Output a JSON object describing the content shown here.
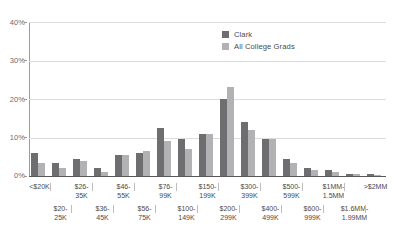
{
  "chart_data": {
    "type": "bar",
    "title": "",
    "subtitle": "",
    "xlabel": "",
    "ylabel": "",
    "ylim": [
      0,
      40
    ],
    "yticks": [
      0,
      10,
      20,
      30,
      40
    ],
    "ytick_labels": [
      "0%",
      "10%",
      "20%",
      "30%",
      "40%"
    ],
    "grid": true,
    "legend_position": "top-right",
    "categories": [
      "<$20K",
      "$20-25K",
      "$26-35K",
      "$36-45K",
      "$46-55K",
      "$56-75K",
      "$76-99K",
      "$100-149K",
      "$150-199K",
      "$200-299K",
      "$300-399K",
      "$400-499K",
      "$500-599K",
      "$600-999K",
      "$1MM-1.5MM",
      "$1.6MM-1.99MM",
      ">$2MM"
    ],
    "series": [
      {
        "name": "Clark",
        "color": "#6e6e70",
        "values": [
          6.0,
          3.5,
          4.5,
          2.0,
          5.5,
          6.0,
          12.5,
          9.5,
          11.0,
          20.0,
          14.0,
          9.5,
          4.5,
          2.0,
          1.5,
          0.6,
          0.4
        ]
      },
      {
        "name": "All College Grads",
        "color": "#b2b2b4",
        "values": [
          3.5,
          2.0,
          4.0,
          1.0,
          5.5,
          6.5,
          9.0,
          7.0,
          11.0,
          23.0,
          12.0,
          9.5,
          3.5,
          1.5,
          1.0,
          0.5,
          0.3
        ]
      }
    ],
    "annotations": []
  },
  "legend": {
    "items": [
      {
        "label": "Clark",
        "swatch": "dark-gray-swatch"
      },
      {
        "label": "All College Grads",
        "swatch": "light-gray-swatch"
      }
    ]
  },
  "xaxis": {
    "row_top": [
      "<$20K",
      "$26-\n35K",
      "$46-\n55K",
      "$76-\n99K",
      "$150-\n199K",
      "$300-\n399K",
      "$500-\n599K",
      "$1MM-\n1.5MM",
      ">$2MM"
    ],
    "row_top_lines": [
      [
        "<$20K",
        ""
      ],
      [
        "$26-",
        "35K"
      ],
      [
        "$46-",
        "55K"
      ],
      [
        "$76-",
        "99K"
      ],
      [
        "$150-",
        "199K"
      ],
      [
        "$300-",
        "399K"
      ],
      [
        "$500-",
        "599K"
      ],
      [
        "$1MM-",
        "1.5MM"
      ],
      [
        ">$2MM",
        ""
      ]
    ],
    "row_bottom_lines": [
      [
        "$20-",
        "25K"
      ],
      [
        "$36-",
        "45K"
      ],
      [
        "$56-",
        "75K"
      ],
      [
        "$100-",
        "149K"
      ],
      [
        "$200-",
        "299K"
      ],
      [
        "$400-",
        "499K"
      ],
      [
        "$600-",
        "999K"
      ],
      [
        "$1.6MM-",
        "1.99MM"
      ]
    ]
  },
  "colors": {
    "clark": "#6e6e70",
    "all_college_grads": "#b2b2b4",
    "gridline": "#dcdcdc",
    "axis": "#58585a",
    "text": "#4a4a4c"
  }
}
